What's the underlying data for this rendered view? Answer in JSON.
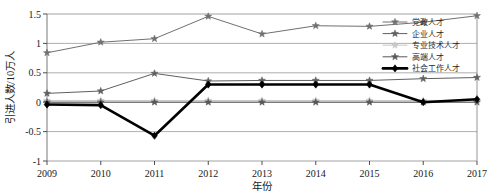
{
  "chart_data": {
    "type": "line",
    "title": "",
    "xlabel": "年份",
    "ylabel": "引进人数/10万人",
    "x": [
      2009,
      2010,
      2011,
      2012,
      2013,
      2014,
      2015,
      2016,
      2017
    ],
    "categories": [
      "2009",
      "2010",
      "2011",
      "2012",
      "2013",
      "2014",
      "2015",
      "2016",
      "2017"
    ],
    "xlim": [
      2009,
      2017
    ],
    "ylim": [
      -1,
      1.5
    ],
    "yticks": [
      -1,
      -0.5,
      0,
      0.5,
      1,
      1.5
    ],
    "ytick_labels": [
      "-1",
      "-0.5",
      "0",
      "0.5",
      "1",
      "1.5"
    ],
    "grid": true,
    "legend_position": "top-right",
    "series": [
      {
        "name": "党政人才",
        "color": "#707070",
        "marker": "star",
        "values": [
          0.84,
          1.02,
          1.08,
          1.46,
          1.16,
          1.3,
          1.29,
          1.36,
          1.47
        ]
      },
      {
        "name": "企业人才",
        "color": "#606060",
        "marker": "star",
        "values": [
          0.15,
          0.19,
          0.49,
          0.36,
          0.37,
          0.37,
          0.37,
          0.4,
          0.42
        ]
      },
      {
        "name": "专业技术人才",
        "color": "#c8c8c8",
        "marker": "star",
        "values": [
          0.03,
          0.03,
          0.03,
          0.03,
          0.03,
          0.03,
          0.03,
          0.03,
          0.03
        ]
      },
      {
        "name": "高端人才",
        "color": "#585858",
        "marker": "star",
        "values": [
          0.0,
          0.0,
          0.0,
          0.0,
          0.0,
          0.0,
          0.0,
          0.0,
          0.0
        ]
      },
      {
        "name": "社会工作人才",
        "color": "#000000",
        "marker": "diamond",
        "values": [
          -0.04,
          -0.05,
          -0.57,
          0.3,
          0.3,
          0.3,
          0.3,
          0.0,
          0.05
        ]
      }
    ]
  }
}
